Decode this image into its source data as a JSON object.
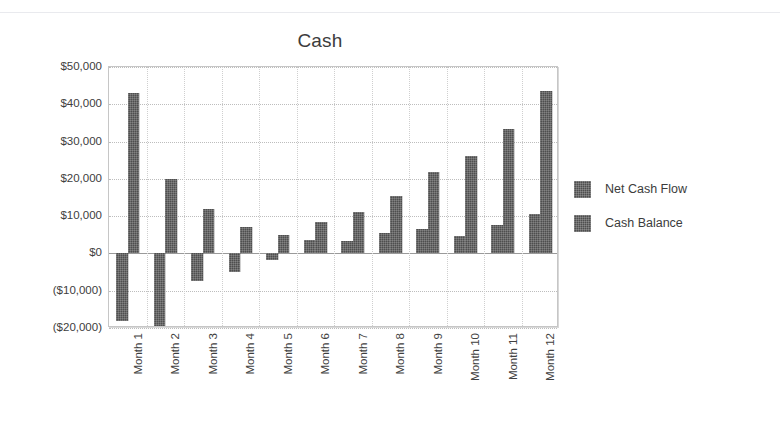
{
  "chart_data": {
    "type": "bar",
    "title": "Cash",
    "xlabel": "",
    "ylabel": "",
    "ylim": [
      -20000,
      50000
    ],
    "ytick_step": 10000,
    "grid": true,
    "legend_position": "right",
    "categories": [
      "Month 1",
      "Month 2",
      "Month 3",
      "Month 4",
      "Month 5",
      "Month 6",
      "Month 7",
      "Month 8",
      "Month 9",
      "Month 10",
      "Month 11",
      "Month 12"
    ],
    "ytick_labels": [
      "$50,000",
      "$40,000",
      "$30,000",
      "$20,000",
      "$10,000",
      "$0",
      "($10,000)",
      "($20,000)"
    ],
    "ytick_values": [
      50000,
      40000,
      30000,
      20000,
      10000,
      0,
      -10000,
      -20000
    ],
    "series": [
      {
        "name": "Net Cash Flow",
        "color": "#4e4e4e",
        "values": [
          -18000,
          -23500,
          -7500,
          -5000,
          -1800,
          3500,
          3300,
          5500,
          6500,
          4800,
          7500,
          10500
        ]
      },
      {
        "name": "Cash Balance",
        "color": "#4e4e4e",
        "values": [
          43000,
          20000,
          12000,
          7200,
          5000,
          8300,
          11000,
          15500,
          21800,
          26000,
          33500,
          43500
        ]
      }
    ]
  },
  "legend": {
    "entries": [
      {
        "label": "Net Cash Flow"
      },
      {
        "label": "Cash Balance"
      }
    ]
  }
}
